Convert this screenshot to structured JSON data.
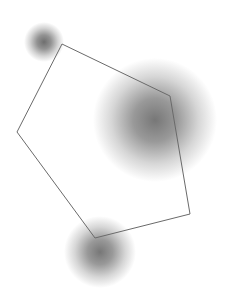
{
  "canvas": {
    "width": 232,
    "height": 308,
    "background": "#ffffff"
  },
  "polygon": {
    "stroke": "#6a6a6a",
    "stroke_width": 1,
    "points": [
      [
        62,
        44
      ],
      [
        170,
        96
      ],
      [
        190,
        214
      ],
      [
        95,
        238
      ],
      [
        17,
        132
      ]
    ]
  },
  "blobs": [
    {
      "cx": 44,
      "cy": 42,
      "r": 20,
      "color": "#555555",
      "opacity": 0.85
    },
    {
      "cx": 155,
      "cy": 120,
      "r": 62,
      "color": "#555555",
      "opacity": 0.8
    },
    {
      "cx": 100,
      "cy": 252,
      "r": 36,
      "color": "#555555",
      "opacity": 0.8
    }
  ]
}
